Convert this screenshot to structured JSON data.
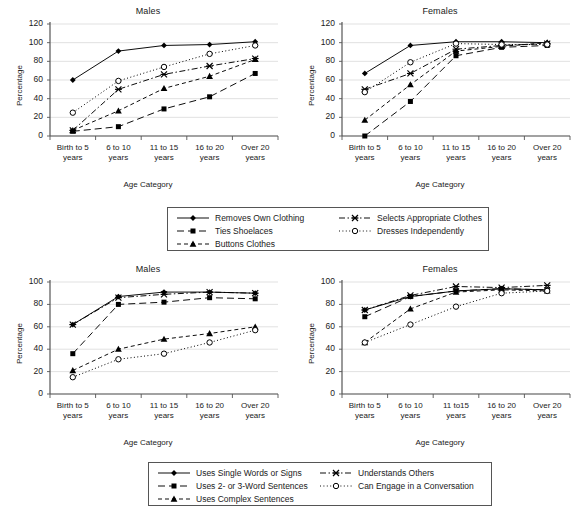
{
  "figure": {
    "background": "#ffffff",
    "axis_color": "#555555",
    "grid_color": "#d9d9d9",
    "series_color": "#000000"
  },
  "chart_data": [
    {
      "id": "dressing-males",
      "type": "line",
      "title": "Males",
      "xlabel": "Age Category",
      "ylabel": "Percentage",
      "ylim": [
        0,
        120
      ],
      "yticks": [
        0,
        20,
        40,
        60,
        80,
        100,
        120
      ],
      "grid": true,
      "legend": "shared-dressing",
      "categories": [
        "Birth to 5 years",
        "6 to 10 years",
        "11 to 15 years",
        "16 to 20 years",
        "Over 20 years"
      ],
      "series": [
        {
          "name": "Removes Own Clothing",
          "marker": "diamond",
          "line": "solid",
          "values": [
            60,
            91,
            97,
            98,
            101
          ]
        },
        {
          "name": "Ties Shoelaces",
          "marker": "square",
          "line": "dashed-long",
          "values": [
            5,
            10,
            29,
            42,
            67
          ]
        },
        {
          "name": "Buttons Clothes",
          "marker": "triangle",
          "line": "dashed",
          "values": [
            6,
            27,
            51,
            64,
            82
          ]
        },
        {
          "name": "Selects Appropriate Clothes",
          "marker": "star",
          "line": "dash-dot",
          "values": [
            6,
            50,
            66,
            75,
            83
          ]
        },
        {
          "name": "Dresses Independently",
          "marker": "circle",
          "line": "dotted",
          "values": [
            25,
            59,
            74,
            88,
            97
          ]
        }
      ]
    },
    {
      "id": "dressing-females",
      "type": "line",
      "title": "Females",
      "xlabel": "Age Category",
      "ylabel": "Percentage",
      "ylim": [
        0,
        120
      ],
      "yticks": [
        0,
        20,
        40,
        60,
        80,
        100,
        120
      ],
      "grid": true,
      "legend": "shared-dressing",
      "categories": [
        "Birth to 5 years",
        "6 to 10 years",
        "11 to 15 years",
        "16 to 20 years",
        "Over 20 years"
      ],
      "series": [
        {
          "name": "Removes Own Clothing",
          "marker": "diamond",
          "line": "solid",
          "values": [
            67,
            97,
            101,
            101,
            100
          ]
        },
        {
          "name": "Ties Shoelaces",
          "marker": "square",
          "line": "dashed-long",
          "values": [
            0,
            37,
            86,
            95,
            97
          ]
        },
        {
          "name": "Buttons Clothes",
          "marker": "triangle",
          "line": "dashed",
          "values": [
            17,
            55,
            91,
            96,
            100
          ]
        },
        {
          "name": "Selects Appropriate Clothes",
          "marker": "star",
          "line": "dash-dot",
          "values": [
            50,
            67,
            93,
            97,
            99
          ]
        },
        {
          "name": "Dresses Independently",
          "marker": "circle",
          "line": "dotted",
          "values": [
            47,
            79,
            99,
            98,
            98
          ]
        }
      ]
    },
    {
      "id": "communication-males",
      "type": "line",
      "title": "Males",
      "xlabel": "Age Category",
      "ylabel": "Percentage",
      "ylim": [
        0,
        100
      ],
      "yticks": [
        0,
        20,
        40,
        60,
        80,
        100
      ],
      "grid": true,
      "legend": "shared-communication",
      "categories": [
        "Birth to 5 years",
        "6 to 10 years",
        "11 to 15 years",
        "16 to 20 years",
        "Over 20 years"
      ],
      "series": [
        {
          "name": "Uses Single Words or Signs",
          "marker": "diamond",
          "line": "solid",
          "values": [
            62,
            87,
            91,
            91,
            90
          ]
        },
        {
          "name": "Uses 2- or 3-Word Sentences",
          "marker": "square",
          "line": "dashed-long",
          "values": [
            36,
            80,
            82,
            86,
            85
          ]
        },
        {
          "name": "Uses Complex Sentences",
          "marker": "triangle",
          "line": "dashed",
          "values": [
            21,
            40,
            49,
            54,
            60
          ]
        },
        {
          "name": "Understands Others",
          "marker": "star",
          "line": "dash-dot",
          "values": [
            62,
            86,
            89,
            91,
            90
          ]
        },
        {
          "name": "Can Engage in a Conversation",
          "marker": "circle",
          "line": "dotted",
          "values": [
            15,
            31,
            36,
            46,
            57
          ]
        }
      ]
    },
    {
      "id": "communication-females",
      "type": "line",
      "title": "Females",
      "xlabel": "Age Category",
      "ylabel": "Percentage",
      "ylim": [
        0,
        100
      ],
      "yticks": [
        0,
        20,
        40,
        60,
        80,
        100
      ],
      "grid": true,
      "legend": "shared-communication",
      "categories": [
        "Birth to 5 years",
        "6 to 10 years",
        "11 to15 years",
        "16 to 20 years",
        "Over 20 years"
      ],
      "series": [
        {
          "name": "Uses Single Words or Signs",
          "marker": "diamond",
          "line": "solid",
          "values": [
            75,
            87,
            92,
            94,
            93
          ]
        },
        {
          "name": "Uses 2- or 3-Word Sentences",
          "marker": "square",
          "line": "dashed-long",
          "values": [
            69,
            87,
            92,
            94,
            93
          ]
        },
        {
          "name": "Uses Complex Sentences",
          "marker": "triangle",
          "line": "dashed",
          "values": [
            46,
            76,
            91,
            93,
            92
          ]
        },
        {
          "name": "Understands Others",
          "marker": "star",
          "line": "dash-dot",
          "values": [
            75,
            88,
            96,
            95,
            97
          ]
        },
        {
          "name": "Can Engage in a Conversation",
          "marker": "circle",
          "line": "dotted",
          "values": [
            46,
            62,
            78,
            90,
            92
          ]
        }
      ]
    }
  ],
  "legends": {
    "dressing": {
      "entries": [
        {
          "label": "Removes Own Clothing",
          "marker": "diamond",
          "line": "solid"
        },
        {
          "label": "Ties Shoelaces",
          "marker": "square",
          "line": "dashed-long"
        },
        {
          "label": "Buttons Clothes",
          "marker": "triangle",
          "line": "dashed"
        },
        {
          "label": "Selects Appropriate Clothes",
          "marker": "star",
          "line": "dash-dot"
        },
        {
          "label": "Dresses Independently",
          "marker": "circle",
          "line": "dotted"
        }
      ]
    },
    "communication": {
      "entries": [
        {
          "label": "Uses Single Words or Signs",
          "marker": "diamond",
          "line": "solid"
        },
        {
          "label": "Uses 2- or 3-Word Sentences",
          "marker": "square",
          "line": "dashed-long"
        },
        {
          "label": "Uses Complex Sentences",
          "marker": "triangle",
          "line": "dashed"
        },
        {
          "label": "Understands Others",
          "marker": "star",
          "line": "dash-dot"
        },
        {
          "label": "Can Engage in a Conversation",
          "marker": "circle",
          "line": "dotted"
        }
      ]
    }
  }
}
